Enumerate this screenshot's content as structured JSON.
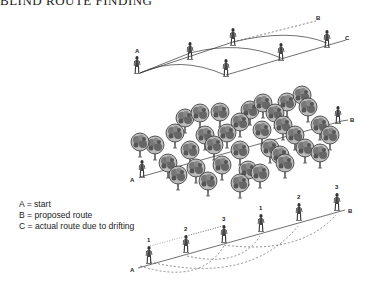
{
  "title": "BLIND ROUTE FINDING",
  "legend": {
    "items": [
      {
        "key": "A",
        "text": "A = start"
      },
      {
        "key": "B",
        "text": "B = proposed route"
      },
      {
        "key": "C",
        "text": "C = actual route due to drifting"
      }
    ]
  },
  "figures": {
    "top": {
      "labels": {
        "start": "A",
        "proposed": "B",
        "actual": "C"
      }
    },
    "middle": {
      "labels": {
        "start": "A",
        "end": "B"
      }
    },
    "bottom": {
      "labels": {
        "start": "A",
        "end": "B"
      },
      "walker_numbers": [
        "1",
        "2",
        "3",
        "1",
        "2",
        "3"
      ]
    }
  },
  "colors": {
    "ink": "#222222",
    "background": "#ffffff"
  }
}
